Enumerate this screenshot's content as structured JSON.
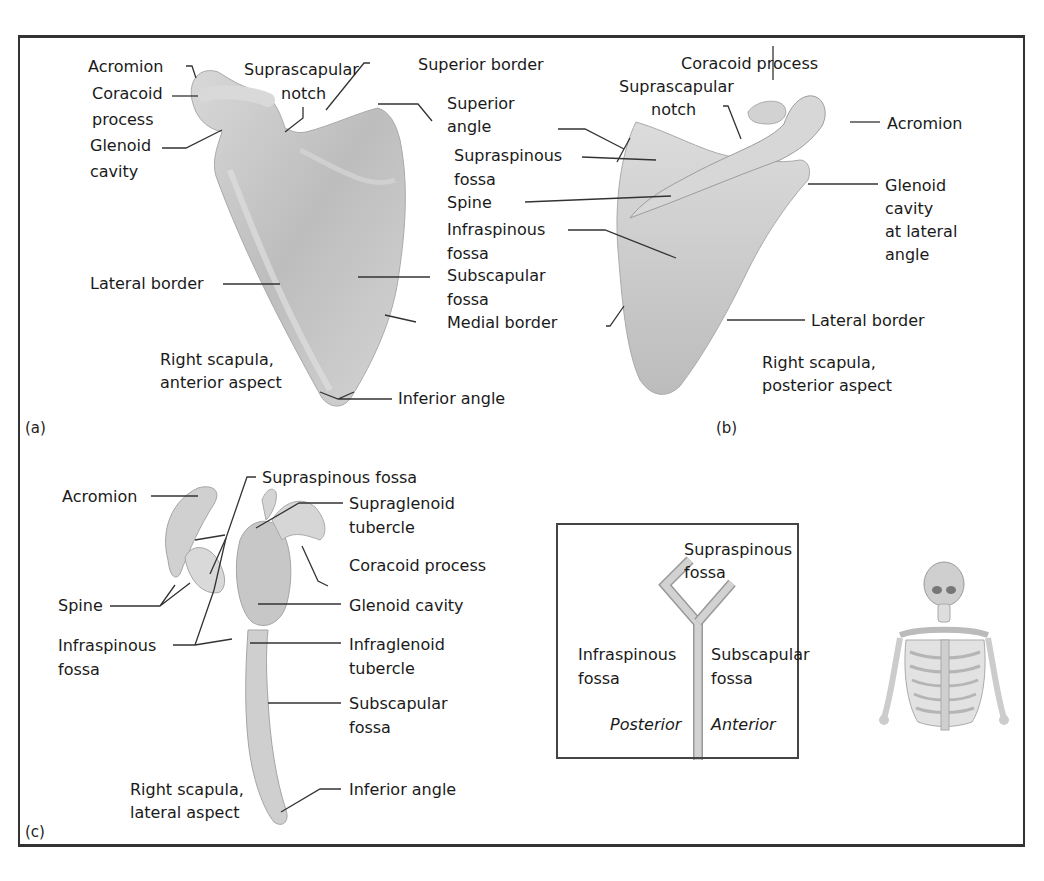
{
  "figure": {
    "panels": [
      {
        "id": "(a)",
        "caption": [
          "Right scapula,",
          "anterior aspect"
        ],
        "labels": {
          "acromion": "Acromion",
          "coracoid_1": "Coracoid",
          "coracoid_2": "process",
          "glenoid_1": "Glenoid",
          "glenoid_2": "cavity",
          "suprascapular_1": "Suprascapular",
          "suprascapular_2": "notch",
          "superior_border": "Superior border",
          "superior_angle_1": "Superior",
          "superior_angle_2": "angle",
          "lateral_border": "Lateral border",
          "subscapular_1": "Subscapular",
          "subscapular_2": "fossa",
          "medial_border": "Medial border",
          "inferior_angle": "Inferior angle"
        }
      },
      {
        "id": "(b)",
        "caption": [
          "Right scapula,",
          "posterior aspect"
        ],
        "labels": {
          "coracoid": "Coracoid process",
          "suprascapular_1": "Suprascapular",
          "suprascapular_2": "notch",
          "acromion": "Acromion",
          "supraspinous_1": "Supraspinous",
          "supraspinous_2": "fossa",
          "spine": "Spine",
          "infraspinous_1": "Infraspinous",
          "infraspinous_2": "fossa",
          "glenoid_1": "Glenoid",
          "glenoid_2": "cavity",
          "glenoid_3": "at lateral",
          "glenoid_4": "angle",
          "lateral_border": "Lateral border"
        }
      },
      {
        "id": "(c)",
        "caption": [
          "Right scapula,",
          "lateral aspect"
        ],
        "labels": {
          "supraspinous": "Supraspinous fossa",
          "acromion": "Acromion",
          "supraglenoid_1": "Supraglenoid",
          "supraglenoid_2": "tubercle",
          "coracoid": "Coracoid process",
          "spine": "Spine",
          "glenoid": "Glenoid cavity",
          "infraspinous_1": "Infraspinous",
          "infraspinous_2": "fossa",
          "infraglenoid_1": "Infraglenoid",
          "infraglenoid_2": "tubercle",
          "subscapular_1": "Subscapular",
          "subscapular_2": "fossa",
          "inferior_angle": "Inferior angle"
        }
      }
    ],
    "inset": {
      "supraspinous_1": "Supraspinous",
      "supraspinous_2": "fossa",
      "infraspinous_1": "Infraspinous",
      "infraspinous_2": "fossa",
      "subscapular_1": "Subscapular",
      "subscapular_2": "fossa",
      "posterior": "Posterior",
      "anterior": "Anterior"
    },
    "colors": {
      "bone": "#c9c9c9",
      "bone_light": "#e2e2e2",
      "bone_dark": "#a8a8a8",
      "leader": "#333333",
      "frame": "#333333"
    }
  }
}
